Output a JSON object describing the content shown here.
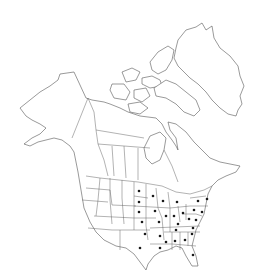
{
  "map": {
    "title": "North America distribution map",
    "region": "North America",
    "colors": {
      "background": "#ffffff",
      "outline": "#555555",
      "dot": "#1a1a1a"
    },
    "marked_regions": [
      {
        "name": "North Dakota",
        "x": 139,
        "y": 191
      },
      {
        "name": "Minnesota",
        "x": 153,
        "y": 196
      },
      {
        "name": "South Dakota",
        "x": 139,
        "y": 202
      },
      {
        "name": "Wisconsin",
        "x": 163,
        "y": 201
      },
      {
        "name": "Michigan",
        "x": 177,
        "y": 202
      },
      {
        "name": "New York",
        "x": 198,
        "y": 201
      },
      {
        "name": "Massachusetts",
        "x": 207,
        "y": 199
      },
      {
        "name": "Nebraska",
        "x": 139,
        "y": 212
      },
      {
        "name": "Iowa",
        "x": 155,
        "y": 211
      },
      {
        "name": "Illinois",
        "x": 166,
        "y": 216
      },
      {
        "name": "Indiana",
        "x": 174,
        "y": 216
      },
      {
        "name": "Ohio",
        "x": 183,
        "y": 213
      },
      {
        "name": "Pennsylvania",
        "x": 194,
        "y": 210
      },
      {
        "name": "New Jersey",
        "x": 202,
        "y": 212
      },
      {
        "name": "Kansas",
        "x": 142,
        "y": 222
      },
      {
        "name": "Missouri",
        "x": 159,
        "y": 222
      },
      {
        "name": "Kentucky",
        "x": 178,
        "y": 224
      },
      {
        "name": "West Virginia",
        "x": 189,
        "y": 219
      },
      {
        "name": "Virginia",
        "x": 196,
        "y": 220
      },
      {
        "name": "Oklahoma",
        "x": 145,
        "y": 234
      },
      {
        "name": "Arkansas",
        "x": 160,
        "y": 236
      },
      {
        "name": "Tennessee",
        "x": 176,
        "y": 230
      },
      {
        "name": "North Carolina",
        "x": 193,
        "y": 228
      },
      {
        "name": "Mississippi",
        "x": 166,
        "y": 242
      },
      {
        "name": "Alabama",
        "x": 175,
        "y": 241
      },
      {
        "name": "Georgia",
        "x": 185,
        "y": 240
      },
      {
        "name": "South Carolina",
        "x": 192,
        "y": 234
      },
      {
        "name": "Texas",
        "x": 140,
        "y": 248
      },
      {
        "name": "Louisiana",
        "x": 160,
        "y": 248
      },
      {
        "name": "Florida",
        "x": 193,
        "y": 255
      }
    ]
  }
}
